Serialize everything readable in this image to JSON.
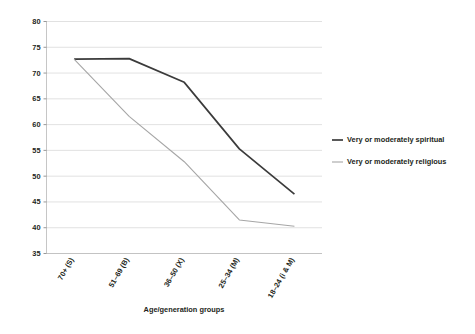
{
  "chart_data": {
    "type": "line",
    "title": "",
    "subtitle": "",
    "xlabel": "Age/generation groups",
    "ylabel": "",
    "categories": [
      "70+ (S)",
      "51–69 (B)",
      "36–50 (X)",
      "25–34 (M)",
      "18–24 (i & M)"
    ],
    "series": [
      {
        "name": "Very or moderately spiritual",
        "color": "#3b3b3b",
        "values": [
          72.7,
          72.8,
          68.2,
          55.3,
          46.5
        ]
      },
      {
        "name": "Very or moderately religious",
        "color": "#a6a6a6",
        "values": [
          72.7,
          61.6,
          52.8,
          41.5,
          40.3
        ]
      }
    ],
    "ylim": [
      35,
      80
    ],
    "ytick_step": 5,
    "yticks": [
      "80",
      "75",
      "70",
      "65",
      "60",
      "55",
      "50",
      "45",
      "40",
      "35"
    ],
    "grid": "horizontal",
    "legend_position": "right",
    "background_color": "#ffffff",
    "gridline_color": "#d9d9d9"
  },
  "legend": {
    "entries": [
      {
        "label": "Very or moderately spiritual",
        "swatch": "legend-swatch-spiritual"
      },
      {
        "label": "Very or moderately religious",
        "swatch": "legend-swatch-religious"
      }
    ]
  }
}
